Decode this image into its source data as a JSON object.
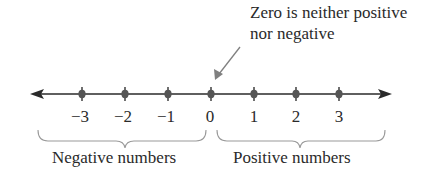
{
  "annotation": {
    "line1": "Zero is neither positive",
    "line2": "nor negative"
  },
  "number_line": {
    "ticks": [
      {
        "value": -3,
        "label": "−3",
        "x": 82
      },
      {
        "value": -2,
        "label": "−2",
        "x": 125
      },
      {
        "value": -1,
        "label": "−1",
        "x": 168
      },
      {
        "value": 0,
        "label": "0",
        "x": 211
      },
      {
        "value": 1,
        "label": "1",
        "x": 254
      },
      {
        "value": 2,
        "label": "2",
        "x": 296
      },
      {
        "value": 3,
        "label": "3",
        "x": 339
      }
    ]
  },
  "braces": {
    "negative_label": "Negative numbers",
    "positive_label": "Positive numbers"
  },
  "colors": {
    "line": "#2a2a2a",
    "point": "#555555",
    "annotation_arrow": "#808080",
    "brace": "#9a9a9a"
  }
}
